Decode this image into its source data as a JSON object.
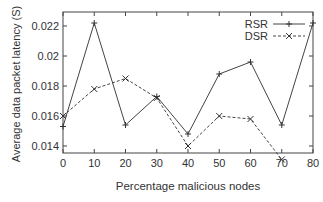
{
  "chart_data": {
    "type": "line",
    "title": "",
    "xlabel": "Percentage malicious nodes",
    "ylabel": "Average data packet latency (S)",
    "x": [
      0,
      10,
      20,
      30,
      40,
      50,
      60,
      70,
      80
    ],
    "xticks": [
      "0",
      "10",
      "20",
      "30",
      "40",
      "50",
      "60",
      "70",
      "80"
    ],
    "yticks": [
      "0.014",
      "0.016",
      "0.018",
      "0.02",
      "0.022"
    ],
    "xlim": [
      0,
      80
    ],
    "ylim": [
      0.013,
      0.0231
    ],
    "grid": false,
    "legend_position": "upper right",
    "series": [
      {
        "name": "RSR",
        "style": "solid",
        "marker": "+",
        "x": [
          0,
          10,
          20,
          30,
          40,
          50,
          60,
          70,
          80
        ],
        "values": [
          0.0153,
          0.0222,
          0.0154,
          0.0173,
          0.0148,
          0.0188,
          0.0196,
          0.0154,
          0.0222
        ]
      },
      {
        "name": "DSR",
        "style": "dashed",
        "marker": "x",
        "x": [
          0,
          10,
          20,
          30,
          40,
          50,
          60,
          70
        ],
        "values": [
          0.016,
          0.0178,
          0.0185,
          0.0172,
          0.014,
          0.016,
          0.0158,
          0.0131
        ]
      }
    ]
  }
}
